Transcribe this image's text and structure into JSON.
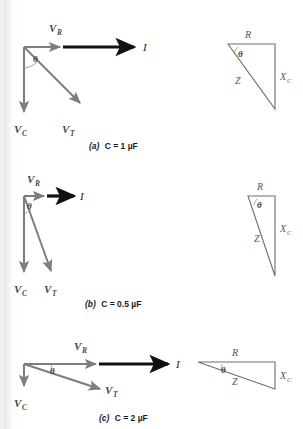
{
  "figure": {
    "colors": {
      "phasor_gray": "#7d7d7d",
      "current_black": "#111111",
      "triangle_gray": "#6e6e6e",
      "label_gray": "#4a4a4a",
      "background": "#ffffff",
      "scan_edge": "#efefef"
    },
    "panels": [
      {
        "id": "a",
        "caption_prefix": "(a)",
        "caption_text": "C = 1 µF",
        "capacitance": "1 µF",
        "phasor": {
          "labels": {
            "vr": "V",
            "vr_sub": "R",
            "vc": "V",
            "vc_sub": "C",
            "vt": "V",
            "vt_sub": "T",
            "current": "I",
            "theta": "θ"
          },
          "vr_length": 45,
          "vc_length": 72,
          "vt_angle_deg": -58,
          "theta_deg": 58
        },
        "triangle": {
          "labels": {
            "r": "R",
            "z": "Z",
            "xc": "X",
            "xc_sub": "C",
            "theta": "θ"
          },
          "r_width": 47,
          "xc_height": 65
        }
      },
      {
        "id": "b",
        "caption_prefix": "(b)",
        "caption_text": "C = 0.5 µF",
        "capacitance": "0.5 µF",
        "phasor": {
          "labels": {
            "vr": "V",
            "vr_sub": "R",
            "vc": "V",
            "vc_sub": "C",
            "vt": "V",
            "vt_sub": "T",
            "current": "I",
            "theta": "θ"
          },
          "vr_length": 26,
          "vc_length": 82,
          "vt_angle_deg": -72,
          "theta_deg": 72
        },
        "triangle": {
          "labels": {
            "r": "R",
            "z": "Z",
            "xc": "X",
            "xc_sub": "C",
            "theta": "θ"
          },
          "r_width": 26,
          "xc_height": 80
        }
      },
      {
        "id": "c",
        "caption_prefix": "(c)",
        "caption_text": "C = 2 µF",
        "capacitance": "2 µF",
        "phasor": {
          "labels": {
            "vr": "V",
            "vr_sub": "R",
            "vc": "V",
            "vc_sub": "C",
            "vt": "V",
            "vt_sub": "T",
            "current": "I",
            "theta": "θ"
          },
          "vr_length": 86,
          "vc_length": 27,
          "vt_angle_deg": -18,
          "theta_deg": 18
        },
        "triangle": {
          "labels": {
            "r": "R",
            "z": "Z",
            "xc": "X",
            "xc_sub": "C",
            "theta": "θ"
          },
          "r_width": 84,
          "xc_height": 27
        }
      }
    ]
  }
}
